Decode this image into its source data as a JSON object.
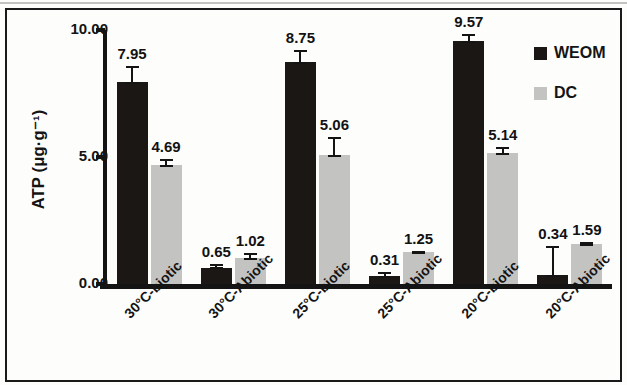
{
  "chart_data": {
    "type": "bar",
    "title": "",
    "xlabel": "",
    "ylabel": "ATP (μg·g⁻¹)",
    "ylim": [
      0,
      10
    ],
    "yticks": [
      "0.00",
      "5.00",
      "10.00"
    ],
    "ytick_values": [
      0,
      5,
      10
    ],
    "grid": false,
    "legend_position": "right",
    "categories": [
      "30°C-biotic",
      "30°C-Abiotic",
      "25°C-biotic",
      "25°C-Abiotic",
      "20°C-biotic",
      "20°C-Abiotic"
    ],
    "series": [
      {
        "name": "WEOM",
        "color": "#1b1715",
        "values": [
          7.95,
          0.65,
          8.75,
          0.31,
          9.57,
          0.34
        ],
        "value_labels": [
          "7.95",
          "0.65",
          "8.75",
          "0.31",
          "9.57",
          "0.34"
        ],
        "errors": [
          0.62,
          0.14,
          0.45,
          0.16,
          0.28,
          1.15
        ]
      },
      {
        "name": "DC",
        "color": "#c3c3c1",
        "values": [
          4.69,
          1.02,
          5.06,
          1.25,
          5.14,
          1.59
        ],
        "value_labels": [
          "4.69",
          "1.02",
          "5.06",
          "1.25",
          "5.14",
          "1.59"
        ],
        "errors": [
          0.22,
          0.2,
          0.72,
          0.06,
          0.26,
          0.05
        ]
      }
    ]
  },
  "legend": {
    "items": [
      {
        "label": "WEOM",
        "color": "#1b1715"
      },
      {
        "label": "DC",
        "color": "#c3c3c1"
      }
    ]
  }
}
